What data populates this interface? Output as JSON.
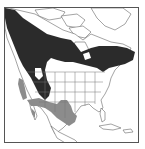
{
  "map": {
    "region": "North America",
    "type": "species range map",
    "colors": {
      "background": "#ffffff",
      "land": "#ffffff",
      "outline": "#555555",
      "range_primary": "#2b2b2b",
      "range_secondary": "#8c8c8c",
      "frame": "#555555"
    },
    "layers": [
      {
        "name": "range-primary",
        "description": "dark fill across boreal Canada, Alaska and the northern Rockies",
        "color": "#2b2b2b"
      },
      {
        "name": "range-secondary",
        "description": "gray fill across California coast, southwest US, Texas and northern Mexico",
        "color": "#8c8c8c"
      }
    ]
  }
}
